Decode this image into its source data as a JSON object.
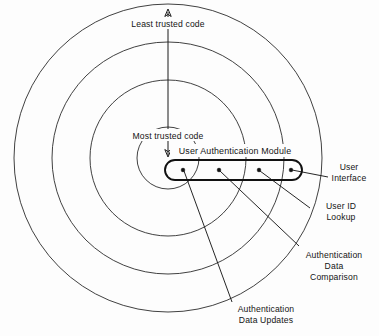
{
  "diagram": {
    "type": "concentric-trust-rings",
    "colors": {
      "background": "#fdfdfd",
      "ring_stroke": "#2b2b2b",
      "capsule_stroke": "#111111",
      "leader_stroke": "#1a1a1a",
      "text": "#141414",
      "dot_fill": "#111111"
    },
    "rings": {
      "count": 4,
      "center": {
        "x": 168,
        "y": 158
      },
      "radii": [
        31,
        78,
        116,
        154
      ]
    },
    "axis": {
      "x": 168,
      "top_y": 10,
      "bottom_y": 156,
      "top_label": "Least trusted code",
      "bottom_label": "Most trusted code",
      "top_arrow": "arrow-up",
      "bottom_arrow": "arrow-down"
    },
    "module": {
      "label": "User Authentication Module",
      "capsule": {
        "x": 165,
        "y": 160,
        "width": 137,
        "height": 20,
        "radius": 10
      },
      "nodes": [
        {
          "name": "authentication-data-updates",
          "x": 183,
          "y": 170
        },
        {
          "name": "authentication-data-comparison",
          "x": 219,
          "y": 170
        },
        {
          "name": "user-id-lookup",
          "x": 259,
          "y": 170
        },
        {
          "name": "user-interface",
          "x": 291,
          "y": 170
        }
      ]
    },
    "callouts": [
      {
        "name": "user-interface",
        "lines": [
          "User",
          "Interface"
        ],
        "text_x": 340,
        "text_y": 170,
        "anchor": "middle",
        "leader": {
          "x1": 292,
          "y1": 170,
          "x2": 328,
          "y2": 177
        }
      },
      {
        "name": "user-id-lookup",
        "lines": [
          "User ID",
          "Lookup"
        ],
        "text_x": 340,
        "text_y": 207,
        "anchor": "middle",
        "leader": {
          "x1": 260,
          "y1": 171,
          "x2": 310,
          "y2": 208
        }
      },
      {
        "name": "authentication-data-comparison",
        "lines": [
          "Authentication",
          "Data",
          "Comparison"
        ],
        "text_x": 333,
        "text_y": 257,
        "anchor": "middle",
        "leader": {
          "x1": 220,
          "y1": 171,
          "x2": 299,
          "y2": 246
        }
      },
      {
        "name": "authentication-data-updates",
        "lines": [
          "Authentication",
          "Data Updates"
        ],
        "text_x": 263,
        "text_y": 311,
        "anchor": "middle",
        "leader": {
          "x1": 184,
          "y1": 171,
          "x2": 232,
          "y2": 302
        }
      }
    ]
  }
}
